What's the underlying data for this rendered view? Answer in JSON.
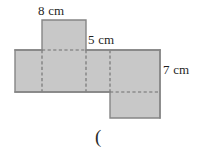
{
  "figure": {
    "kind": "net-of-rectangular-prism",
    "background_color": "#ffffff",
    "fill_color": "#c8c8c8",
    "stroke_color": "#808080",
    "dashed_color": "#707070",
    "text_color": "#1f1f1f",
    "labels": {
      "top": "8 cm",
      "middle": "5 cm",
      "right": "7 cm"
    },
    "caption": "(",
    "faces": [
      {
        "name": "top-flap",
        "x": 42,
        "y": 20,
        "width": 44,
        "height": 30
      },
      {
        "name": "band-left-face",
        "x": 15,
        "y": 50,
        "width": 27,
        "height": 42
      },
      {
        "name": "band-front-face",
        "x": 42,
        "y": 50,
        "width": 44,
        "height": 42
      },
      {
        "name": "band-right-face",
        "x": 86,
        "y": 50,
        "width": 24,
        "height": 42
      },
      {
        "name": "band-back-face",
        "x": 110,
        "y": 50,
        "width": 50,
        "height": 42
      },
      {
        "name": "bottom-flap",
        "x": 110,
        "y": 92,
        "width": 50,
        "height": 26
      }
    ],
    "fold_lines": [
      {
        "name": "fold-vertical-left",
        "x1": 42,
        "y1": 50,
        "x2": 42,
        "y2": 92
      },
      {
        "name": "fold-vertical-mid",
        "x1": 86,
        "y1": 50,
        "x2": 86,
        "y2": 92
      },
      {
        "name": "fold-vertical-right",
        "x1": 110,
        "y1": 50,
        "x2": 110,
        "y2": 92
      },
      {
        "name": "fold-horizontal-top",
        "x1": 42,
        "y1": 50,
        "x2": 86,
        "y2": 50
      },
      {
        "name": "fold-horizontal-bot",
        "x1": 110,
        "y1": 92,
        "x2": 160,
        "y2": 92
      }
    ]
  }
}
